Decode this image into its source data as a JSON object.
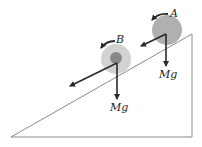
{
  "figure": {
    "ball_a": {
      "label": "A",
      "force_label": "Mg"
    },
    "ball_b": {
      "label": "B",
      "force_label": "Mg"
    },
    "colors": {
      "incline": "#8a8a8a",
      "arrow": "#2a2a2a",
      "ball_a_fill": "#b0b0b0",
      "ball_b_outer": "#d2d2d2",
      "ball_b_inner": "#888888"
    }
  }
}
